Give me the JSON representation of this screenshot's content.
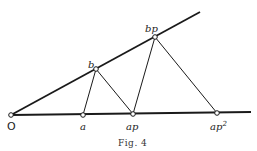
{
  "figure": {
    "caption": "Fig. 4",
    "colors": {
      "line": "#1a1a1a",
      "point_fill": "#ffffff",
      "background": "#ffffff"
    },
    "points": {
      "O": {
        "label": "O",
        "x": 11,
        "y": 115
      },
      "a": {
        "label": "a",
        "x": 83,
        "y": 115
      },
      "ap": {
        "label": "ap",
        "x": 133,
        "y": 114
      },
      "ap2": {
        "label": "ap",
        "sup": "2",
        "x": 217,
        "y": 113
      },
      "b": {
        "label": "b",
        "x": 96,
        "y": 69
      },
      "bp": {
        "label": "bp",
        "x": 155,
        "y": 37
      }
    },
    "rays": [
      {
        "name": "base-ray",
        "from": "O",
        "to_xy": [
          251,
          112
        ]
      },
      {
        "name": "upper-ray",
        "from": "O",
        "to_xy": [
          200,
          12
        ]
      }
    ],
    "segments": [
      [
        "a",
        "b"
      ],
      [
        "b",
        "ap"
      ],
      [
        "ap",
        "bp"
      ],
      [
        "bp",
        "ap2"
      ]
    ]
  }
}
